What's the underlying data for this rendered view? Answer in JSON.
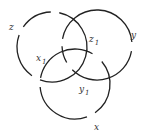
{
  "diagram": {
    "stroke_color": "#222222",
    "background": "#ffffff",
    "rings": [
      {
        "name": "z",
        "label": "z"
      },
      {
        "name": "y",
        "label": "y"
      },
      {
        "name": "x",
        "label": "x"
      }
    ],
    "labels": {
      "z": {
        "base": "z",
        "sub": ""
      },
      "y": {
        "base": "y",
        "sub": ""
      },
      "x": {
        "base": "x",
        "sub": ""
      },
      "z1": {
        "base": "z",
        "sub": "1"
      },
      "x1": {
        "base": "x",
        "sub": "1"
      },
      "y1": {
        "base": "y",
        "sub": "1"
      }
    }
  }
}
